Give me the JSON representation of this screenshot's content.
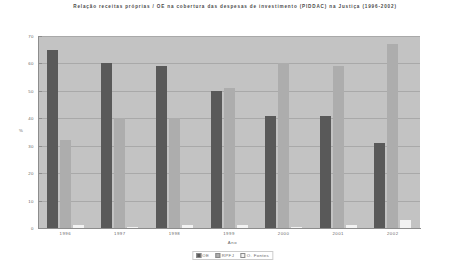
{
  "chart_data": {
    "type": "bar",
    "title": "Relação receitas próprias / OE na cobertura das despesas de investimento (PIDDAC) na Justiça (1996-2002)",
    "xlabel": "Ano",
    "ylabel": "%",
    "categories": [
      "1996",
      "1997",
      "1998",
      "1999",
      "2000",
      "2001",
      "2002"
    ],
    "series": [
      {
        "name": "OE",
        "color": "#595959",
        "values": [
          65,
          60,
          59,
          50,
          41,
          41,
          31
        ]
      },
      {
        "name": "RPFJ",
        "color": "#adadad",
        "values": [
          32,
          40,
          40,
          51,
          60,
          59,
          67
        ]
      },
      {
        "name": "O. Fontes",
        "color": "#f2f2f2",
        "values": [
          1,
          0.5,
          1,
          1,
          0.5,
          1,
          3
        ]
      }
    ],
    "ylim": [
      0,
      70
    ],
    "yticks": [
      "0",
      "10",
      "20",
      "30",
      "40",
      "50",
      "60",
      "70"
    ],
    "ytick_values": [
      0,
      10,
      20,
      30,
      40,
      50,
      60,
      70
    ],
    "grid": true,
    "legend_position": "bottom",
    "plot_background": "#c3c3c3"
  }
}
